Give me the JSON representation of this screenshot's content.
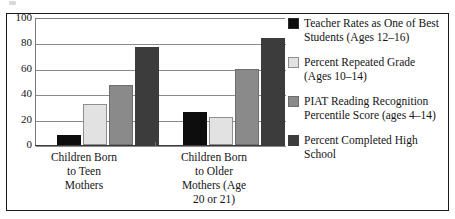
{
  "chart_data": {
    "type": "bar",
    "title": "",
    "xlabel": "",
    "ylabel": "",
    "ylim": [
      0,
      100
    ],
    "yticks": [
      0,
      20,
      40,
      60,
      80,
      100
    ],
    "grid": true,
    "legend_position": "right",
    "categories": [
      "Children Born\nto Teen\nMothers",
      "Children Born\nto Older\nMothers (Age\n20 or 21)"
    ],
    "series": [
      {
        "name": "Teacher Rates as One of Best Students (Ages 12–16)",
        "color": "#0d0d0d",
        "values": [
          8,
          26
        ]
      },
      {
        "name": "Percent Repeated Grade (Ages 10–14)",
        "color": "#e2e2e2",
        "values": [
          32,
          22
        ]
      },
      {
        "name": "PIAT Reading Recognition Percentile Score (ages 4–14)",
        "color": "#8a8a8a",
        "values": [
          47,
          60
        ]
      },
      {
        "name": "Percent Completed High School",
        "color": "#3c3c3c",
        "values": [
          77,
          84
        ]
      }
    ]
  },
  "legend": {
    "entries": [
      {
        "label": "Teacher Rates as One of Best Students (Ages 12–16)"
      },
      {
        "label": "Percent Repeated Grade (Ages 10–14)"
      },
      {
        "label": "PIAT Reading Recognition Percentile Score (ages 4–14)"
      },
      {
        "label": "Percent Completed High School"
      }
    ]
  }
}
